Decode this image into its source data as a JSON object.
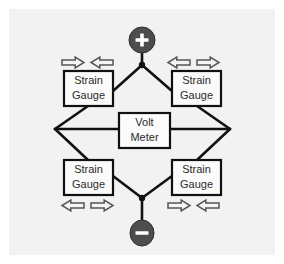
{
  "figure": {
    "panel_background": "#f2f2f2",
    "page_background": "#ffffff",
    "wire_color": "#111111",
    "box_fill": "#fbfbfb",
    "box_stroke": "#111111",
    "label_color": "#2b2b2b",
    "terminal_fill": "#4d4d4d",
    "terminal_glyph_color": "#ffffff",
    "arrow_fill": "#f4f4f4",
    "arrow_stroke": "#555555"
  },
  "terminals": [
    {
      "id": "positive",
      "icon": "plus-circle-icon",
      "symbol": "+",
      "position": "top",
      "cx": 133,
      "cy": 31,
      "rx": 13,
      "ry": 13
    },
    {
      "id": "negative",
      "icon": "minus-circle-icon",
      "symbol": "–",
      "position": "bottom",
      "cx": 133,
      "cy": 224,
      "rx": 12,
      "ry": 13
    }
  ],
  "nodes": [
    {
      "id": "top-node",
      "cx": 133,
      "cy": 56,
      "r": 3.2
    },
    {
      "id": "bottom-node",
      "cx": 133,
      "cy": 189,
      "r": 3.2
    },
    {
      "id": "left-node",
      "cx": 46,
      "cy": 120,
      "r": 0
    },
    {
      "id": "right-node",
      "cx": 221,
      "cy": 120,
      "r": 0
    }
  ],
  "gauges": [
    {
      "id": "strain-gauge-top-left",
      "line1": "Strain",
      "line2": "Gauge",
      "x": 55,
      "y": 62,
      "width": 49,
      "height": 35
    },
    {
      "id": "strain-gauge-top-right",
      "line1": "Strain",
      "line2": "Gauge",
      "x": 163,
      "y": 62,
      "width": 49,
      "height": 35
    },
    {
      "id": "strain-gauge-bottom-left",
      "line1": "Strain",
      "line2": "Gauge",
      "x": 55,
      "y": 151,
      "width": 49,
      "height": 35
    },
    {
      "id": "strain-gauge-bottom-right",
      "line1": "Strain",
      "line2": "Gauge",
      "x": 163,
      "y": 151,
      "width": 49,
      "height": 35
    }
  ],
  "meter": {
    "id": "volt-meter",
    "line1": "Volt",
    "line2": "Meter",
    "x": 110,
    "y": 104,
    "width": 51,
    "height": 35
  },
  "force_arrows": [
    {
      "id": "arrow-top-left-inner-right",
      "direction": "right",
      "x": 53,
      "y": 48,
      "width": 22,
      "height": 11,
      "group": "top-left",
      "meaning": "compression"
    },
    {
      "id": "arrow-top-left-inner-left",
      "direction": "left",
      "x": 82,
      "y": 48,
      "width": 22,
      "height": 11,
      "group": "top-left",
      "meaning": "compression"
    },
    {
      "id": "arrow-top-right-inner-left",
      "direction": "left",
      "x": 159,
      "y": 48,
      "width": 22,
      "height": 11,
      "group": "top-right",
      "meaning": "tension"
    },
    {
      "id": "arrow-top-right-inner-right",
      "direction": "right",
      "x": 188,
      "y": 48,
      "width": 22,
      "height": 11,
      "group": "top-right",
      "meaning": "tension"
    },
    {
      "id": "arrow-bottom-left-outer-left",
      "direction": "left",
      "x": 53,
      "y": 191,
      "width": 22,
      "height": 11,
      "group": "bottom-left",
      "meaning": "tension"
    },
    {
      "id": "arrow-bottom-left-outer-right",
      "direction": "right",
      "x": 82,
      "y": 191,
      "width": 22,
      "height": 11,
      "group": "bottom-left",
      "meaning": "tension"
    },
    {
      "id": "arrow-bottom-right-inner-right",
      "direction": "right",
      "x": 159,
      "y": 191,
      "width": 22,
      "height": 11,
      "group": "bottom-right",
      "meaning": "compression"
    },
    {
      "id": "arrow-bottom-right-inner-left",
      "direction": "left",
      "x": 188,
      "y": 191,
      "width": 22,
      "height": 11,
      "group": "bottom-right",
      "meaning": "compression"
    }
  ],
  "wires": [
    {
      "id": "wire-plus-to-top-node",
      "points": "133,44 133,56"
    },
    {
      "id": "wire-top-node-to-tl",
      "points": "133,56 104,82"
    },
    {
      "id": "wire-top-node-to-tr",
      "points": "133,56 163,82"
    },
    {
      "id": "wire-tl-to-left",
      "points": "79,97 46,120"
    },
    {
      "id": "wire-tr-to-right",
      "points": "188,97 221,120"
    },
    {
      "id": "wire-left-to-bl",
      "points": "46,120 79,151"
    },
    {
      "id": "wire-right-to-br",
      "points": "221,120 188,151"
    },
    {
      "id": "wire-bl-to-bottom-node",
      "points": "104,167 133,189"
    },
    {
      "id": "wire-br-to-bottom-node",
      "points": "163,167 133,189"
    },
    {
      "id": "wire-bottom-node-minus",
      "points": "133,189 133,211"
    },
    {
      "id": "wire-left-to-meter",
      "points": "46,120 110,120"
    },
    {
      "id": "wire-meter-to-right",
      "points": "161,120 221,120"
    }
  ]
}
